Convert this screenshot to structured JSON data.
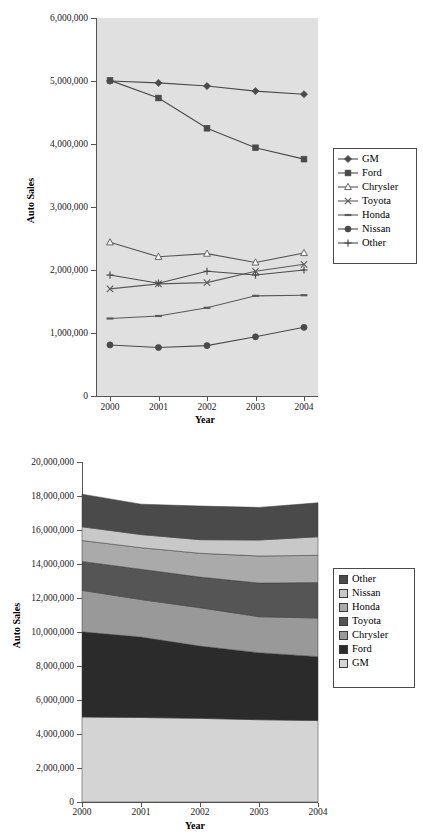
{
  "page": {
    "title_partial": "",
    "background": "#ffffff"
  },
  "charts": [
    {
      "id": "auto-sales-line-chart",
      "type": "line",
      "title": "",
      "xlabel": "Year",
      "ylabel": "Auto Sales",
      "categories": [
        "2000",
        "2001",
        "2002",
        "2003",
        "2004"
      ],
      "ytick_labels": [
        "0",
        "1,000,000",
        "2,000,000",
        "3,000,000",
        "4,000,000",
        "5,000,000",
        "6,000,000"
      ],
      "ylim": [
        0,
        6000000
      ],
      "ystep": 1000000,
      "grid": false,
      "legend_position": "right",
      "plot_background": "#e0e0e0",
      "series": [
        {
          "name": "GM",
          "marker": "diamond",
          "color": "#4a4a4a",
          "values": [
            5000000,
            4970000,
            4920000,
            4840000,
            4790000
          ]
        },
        {
          "name": "Ford",
          "marker": "square",
          "color": "#4a4a4a",
          "values": [
            5010000,
            4730000,
            4250000,
            3940000,
            3760000
          ]
        },
        {
          "name": "Chrysler",
          "marker": "triangle-open",
          "color": "#555555",
          "values": [
            2440000,
            2210000,
            2260000,
            2120000,
            2270000
          ]
        },
        {
          "name": "Toyota",
          "marker": "x",
          "color": "#5a5a5a",
          "values": [
            1700000,
            1780000,
            1800000,
            1980000,
            2090000
          ]
        },
        {
          "name": "Honda",
          "marker": "dash",
          "color": "#5a5a5a",
          "values": [
            1230000,
            1270000,
            1400000,
            1590000,
            1600000
          ]
        },
        {
          "name": "Nissan",
          "marker": "circle",
          "color": "#4a4a4a",
          "values": [
            810000,
            770000,
            800000,
            940000,
            1090000
          ]
        },
        {
          "name": "Other",
          "marker": "plus",
          "color": "#4a4a4a",
          "values": [
            1920000,
            1790000,
            1980000,
            1920000,
            2000000
          ]
        }
      ]
    },
    {
      "id": "auto-sales-area-chart",
      "type": "area",
      "title": "",
      "xlabel": "Year",
      "ylabel": "Auto Sales",
      "categories": [
        "2000",
        "2001",
        "2002",
        "2003",
        "2004"
      ],
      "ytick_labels": [
        "0",
        "2,000,000",
        "4,000,000",
        "6,000,000",
        "8,000,000",
        "10,000,000",
        "12,000,000",
        "14,000,000",
        "16,000,000",
        "18,000,000",
        "20,000,000"
      ],
      "ylim": [
        0,
        20000000
      ],
      "ystep": 2000000,
      "grid": false,
      "stacked": true,
      "legend_position": "right",
      "plot_background": "#ffffff",
      "legend_order": [
        "Other",
        "Nissan",
        "Honda",
        "Toyota",
        "Chrysler",
        "Ford",
        "GM"
      ],
      "series": [
        {
          "name": "GM",
          "color": "#d4d4d4",
          "values": [
            5000000,
            4970000,
            4920000,
            4840000,
            4790000
          ]
        },
        {
          "name": "Ford",
          "color": "#2b2b2b",
          "values": [
            5010000,
            4730000,
            4250000,
            3940000,
            3760000
          ]
        },
        {
          "name": "Chrysler",
          "color": "#999999",
          "values": [
            2440000,
            2210000,
            2260000,
            2120000,
            2270000
          ]
        },
        {
          "name": "Toyota",
          "color": "#555555",
          "values": [
            1700000,
            1780000,
            1800000,
            1980000,
            2090000
          ]
        },
        {
          "name": "Honda",
          "color": "#aaaaaa",
          "values": [
            1230000,
            1270000,
            1400000,
            1590000,
            1600000
          ]
        },
        {
          "name": "Nissan",
          "color": "#c8c8c8",
          "values": [
            810000,
            770000,
            800000,
            940000,
            1090000
          ]
        },
        {
          "name": "Other",
          "color": "#4a4a4a",
          "values": [
            1920000,
            1790000,
            1980000,
            1920000,
            2000000
          ]
        }
      ],
      "totals": [
        18110000,
        17520000,
        17410000,
        17330000,
        17600000
      ]
    }
  ],
  "chart_data": [
    {
      "type": "line",
      "title": "",
      "xlabel": "Year",
      "ylabel": "Auto Sales",
      "categories": [
        "2000",
        "2001",
        "2002",
        "2003",
        "2004"
      ],
      "ylim": [
        0,
        6000000
      ],
      "yticks": [
        0,
        1000000,
        2000000,
        3000000,
        4000000,
        5000000,
        6000000
      ],
      "grid": false,
      "legend_position": "right",
      "series": [
        {
          "name": "GM",
          "values": [
            5000000,
            4970000,
            4920000,
            4840000,
            4790000
          ]
        },
        {
          "name": "Ford",
          "values": [
            5010000,
            4730000,
            4250000,
            3940000,
            3760000
          ]
        },
        {
          "name": "Chrysler",
          "values": [
            2440000,
            2210000,
            2260000,
            2120000,
            2270000
          ]
        },
        {
          "name": "Toyota",
          "values": [
            1700000,
            1780000,
            1800000,
            1980000,
            2090000
          ]
        },
        {
          "name": "Honda",
          "values": [
            1230000,
            1270000,
            1400000,
            1590000,
            1600000
          ]
        },
        {
          "name": "Nissan",
          "values": [
            810000,
            770000,
            800000,
            940000,
            1090000
          ]
        },
        {
          "name": "Other",
          "values": [
            1920000,
            1790000,
            1980000,
            1920000,
            2000000
          ]
        }
      ]
    },
    {
      "type": "area",
      "stacked": true,
      "title": "",
      "xlabel": "Year",
      "ylabel": "Auto Sales",
      "categories": [
        "2000",
        "2001",
        "2002",
        "2003",
        "2004"
      ],
      "ylim": [
        0,
        20000000
      ],
      "yticks": [
        0,
        2000000,
        4000000,
        6000000,
        8000000,
        10000000,
        12000000,
        14000000,
        16000000,
        18000000,
        20000000
      ],
      "grid": false,
      "legend_position": "right",
      "stack_order_bottom_to_top": [
        "GM",
        "Ford",
        "Chrysler",
        "Toyota",
        "Honda",
        "Nissan",
        "Other"
      ],
      "series": [
        {
          "name": "GM",
          "values": [
            5000000,
            4970000,
            4920000,
            4840000,
            4790000
          ]
        },
        {
          "name": "Ford",
          "values": [
            5010000,
            4730000,
            4250000,
            3940000,
            3760000
          ]
        },
        {
          "name": "Chrysler",
          "values": [
            2440000,
            2210000,
            2260000,
            2120000,
            2270000
          ]
        },
        {
          "name": "Toyota",
          "values": [
            1700000,
            1780000,
            1800000,
            1980000,
            2090000
          ]
        },
        {
          "name": "Honda",
          "values": [
            1230000,
            1270000,
            1400000,
            1590000,
            1600000
          ]
        },
        {
          "name": "Nissan",
          "values": [
            810000,
            770000,
            800000,
            940000,
            1090000
          ]
        },
        {
          "name": "Other",
          "values": [
            1920000,
            1790000,
            1980000,
            1920000,
            2000000
          ]
        }
      ],
      "totals": [
        18110000,
        17520000,
        17410000,
        17330000,
        17600000
      ]
    }
  ]
}
